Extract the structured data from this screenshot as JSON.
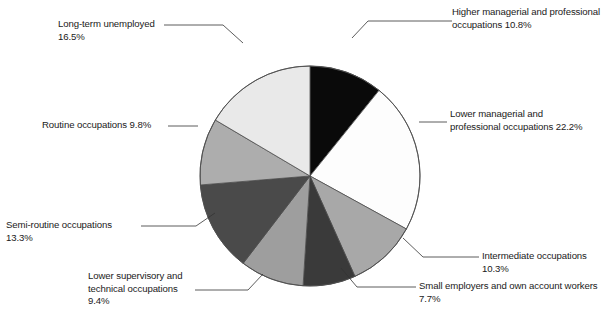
{
  "chart_data": {
    "type": "pie",
    "title": "",
    "subtitle": "",
    "xlabel": "",
    "ylabel": "",
    "legend_position": "callout-labels",
    "grid": false,
    "units": "%",
    "total": 100.0,
    "start_angle_deg": 0,
    "direction": "clockwise",
    "categories": [
      "Higher managerial and professional occupations",
      "Lower managerial and professional occupations",
      "Intermediate occupations",
      "Small employers and own account workers",
      "Lower supervisory and technical occupations",
      "Semi-routine occupations",
      "Routine occupations",
      "Long-term unemployed"
    ],
    "values": [
      10.8,
      22.2,
      10.3,
      7.7,
      9.4,
      13.3,
      9.8,
      16.5
    ],
    "colors": [
      "#0a0a0a",
      "#fdfdfd",
      "#a8a8a8",
      "#3a3a3a",
      "#9e9e9e",
      "#4a4a4a",
      "#adadad",
      "#e9e9e9"
    ],
    "slice_stroke": "#4d4d4d",
    "slices": [
      {
        "label": "Higher managerial and professional occupations",
        "value": 10.8,
        "value_text": "10.8%",
        "color": "#0a0a0a"
      },
      {
        "label": "Lower managerial and professional occupations",
        "value": 22.2,
        "value_text": "22.2%",
        "color": "#fdfdfd"
      },
      {
        "label": "Intermediate occupations",
        "value": 10.3,
        "value_text": "10.3%",
        "color": "#a8a8a8"
      },
      {
        "label": "Small employers and own account workers",
        "value": 7.7,
        "value_text": "7.7%",
        "color": "#3a3a3a"
      },
      {
        "label": "Lower supervisory and technical occupations",
        "value": 9.4,
        "value_text": "9.4%",
        "color": "#9e9e9e"
      },
      {
        "label": "Semi-routine occupations",
        "value": 13.3,
        "value_text": "13.3%",
        "color": "#4a4a4a"
      },
      {
        "label": "Routine occupations",
        "value": 9.8,
        "value_text": "9.8%",
        "color": "#adadad"
      },
      {
        "label": "Long-term unemployed",
        "value": 16.5,
        "value_text": "16.5%",
        "color": "#e9e9e9"
      }
    ]
  },
  "callouts": {
    "higher_managerial": "Higher managerial and professional\noccupations 10.8%",
    "lower_managerial": "Lower managerial and\nprofessional occupations 22.2%",
    "intermediate": "Intermediate occupations 10.3%",
    "small_employers": "Small employers and own account workers 7.7%",
    "lower_supervisory": "Lower supervisory and\ntechnical occupations 9.4%",
    "semi_routine": "Semi-routine occupations 13.3%",
    "routine": "Routine occupations 9.8%",
    "long_term_unemployed": "Long-term unemployed 16.5%"
  }
}
